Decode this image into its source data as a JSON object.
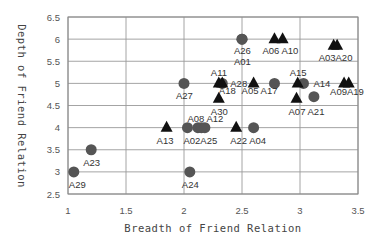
{
  "chart_data": {
    "type": "scatter",
    "title": "",
    "xlabel": "Breadth of Friend Relation",
    "ylabel": "Depth of Friend Relation",
    "xlim": [
      1,
      3.5
    ],
    "ylim": [
      2.5,
      6.5
    ],
    "xticks": [
      "1",
      "1.5",
      "2",
      "2.5",
      "3",
      "3.5"
    ],
    "yticks": [
      "2.5",
      "3",
      "3.5",
      "4",
      "4.5",
      "5",
      "5.5",
      "6",
      "6.5"
    ],
    "grid": true,
    "legend": "none",
    "series": [
      {
        "name": "circle",
        "marker": "circle",
        "color": "#555555",
        "points": [
          {
            "label": "A29",
            "x": 1.05,
            "y": 3.0
          },
          {
            "label": "A23",
            "x": 1.2,
            "y": 3.5
          },
          {
            "label": "A24",
            "x": 2.05,
            "y": 3.0
          },
          {
            "label": "A27",
            "x": 2.0,
            "y": 5.0
          },
          {
            "label": "A02",
            "x": 2.03,
            "y": 4.0
          },
          {
            "label": "A08",
            "x": 2.12,
            "y": 4.0
          },
          {
            "label": "A12",
            "x": 2.15,
            "y": 4.0
          },
          {
            "label": "A25",
            "x": 2.18,
            "y": 4.0
          },
          {
            "label": "A04",
            "x": 2.6,
            "y": 4.0
          },
          {
            "label": "A26",
            "x": 2.5,
            "y": 6.0
          },
          {
            "label": "A01",
            "x": 2.5,
            "y": 6.0
          },
          {
            "label": "A28",
            "x": 2.33,
            "y": 5.0
          },
          {
            "label": "A17",
            "x": 2.78,
            "y": 5.0
          },
          {
            "label": "A14",
            "x": 3.03,
            "y": 5.0
          },
          {
            "label": "A21",
            "x": 3.12,
            "y": 4.7
          }
        ]
      },
      {
        "name": "triangle",
        "marker": "triangle",
        "color": "#111111",
        "points": [
          {
            "label": "A13",
            "x": 1.85,
            "y": 4.0
          },
          {
            "label": "A22",
            "x": 2.45,
            "y": 4.0
          },
          {
            "label": "A30",
            "x": 2.3,
            "y": 4.65
          },
          {
            "label": "A11",
            "x": 2.3,
            "y": 5.0
          },
          {
            "label": "A18",
            "x": 2.33,
            "y": 5.0
          },
          {
            "label": "A05",
            "x": 2.6,
            "y": 5.0
          },
          {
            "label": "A06",
            "x": 2.78,
            "y": 6.0
          },
          {
            "label": "A10",
            "x": 2.85,
            "y": 6.0
          },
          {
            "label": "A15",
            "x": 2.98,
            "y": 5.0
          },
          {
            "label": "A07",
            "x": 2.97,
            "y": 4.65
          },
          {
            "label": "A03",
            "x": 3.29,
            "y": 5.85
          },
          {
            "label": "A20",
            "x": 3.32,
            "y": 5.85
          },
          {
            "label": "A09",
            "x": 3.38,
            "y": 5.0
          },
          {
            "label": "A19",
            "x": 3.42,
            "y": 5.0
          }
        ]
      }
    ],
    "annotations": [
      {
        "text": "A29",
        "x": 1.05,
        "y": 3.0,
        "dx": -5,
        "dy": 16
      },
      {
        "text": "A23",
        "x": 1.2,
        "y": 3.5,
        "dx": -8,
        "dy": 16
      },
      {
        "text": "A24",
        "x": 2.05,
        "y": 3.0,
        "dx": -8,
        "dy": 16
      },
      {
        "text": "A27",
        "x": 2.0,
        "y": 5.0,
        "dx": -8,
        "dy": 16
      },
      {
        "text": "A13",
        "x": 1.85,
        "y": 4.0,
        "dx": -10,
        "dy": 16
      },
      {
        "text": "A02A25",
        "x": 2.03,
        "y": 4.0,
        "dx": -4,
        "dy": 16
      },
      {
        "text": "A08 A12",
        "x": 2.03,
        "y": 4.0,
        "dx": 0,
        "dy": -6
      },
      {
        "text": "A22 A04",
        "x": 2.45,
        "y": 4.0,
        "dx": -6,
        "dy": 16
      },
      {
        "text": "A30",
        "x": 2.3,
        "y": 4.65,
        "dx": -8,
        "dy": 16
      },
      {
        "text": "A11",
        "x": 2.3,
        "y": 5.0,
        "dx": -8,
        "dy": -7
      },
      {
        "text": "A18",
        "x": 2.3,
        "y": 5.0,
        "dx": 0,
        "dy": 11
      },
      {
        "text": "A28",
        "x": 2.33,
        "y": 5.0,
        "dx": 8,
        "dy": 4
      },
      {
        "text": "A05 A17",
        "x": 2.6,
        "y": 5.0,
        "dx": -12,
        "dy": 11
      },
      {
        "text": "A26",
        "x": 2.5,
        "y": 6.0,
        "dx": -8,
        "dy": 15
      },
      {
        "text": "A01",
        "x": 2.5,
        "y": 6.0,
        "dx": -8,
        "dy": 26
      },
      {
        "text": "A06 A10",
        "x": 2.78,
        "y": 6.0,
        "dx": -12,
        "dy": 15
      },
      {
        "text": "A15",
        "x": 2.98,
        "y": 5.0,
        "dx": -8,
        "dy": -7
      },
      {
        "text": "A14",
        "x": 3.03,
        "y": 5.0,
        "dx": 10,
        "dy": 4
      },
      {
        "text": "A07 A21",
        "x": 2.97,
        "y": 4.65,
        "dx": -8,
        "dy": 16
      },
      {
        "text": "A03A20",
        "x": 3.29,
        "y": 5.85,
        "dx": -15,
        "dy": 15
      },
      {
        "text": "A09A19",
        "x": 3.38,
        "y": 5.0,
        "dx": -14,
        "dy": 12
      }
    ]
  }
}
